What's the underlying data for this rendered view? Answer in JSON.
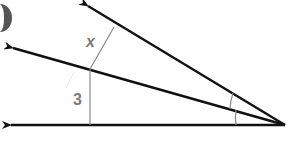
{
  "diagram": {
    "labels": {
      "segment_top": "x",
      "segment_bottom": "3"
    },
    "colors": {
      "ray": "#111111",
      "segment": "#8a8a8a",
      "label": "#7a7a7a",
      "badge": "#555555"
    }
  }
}
